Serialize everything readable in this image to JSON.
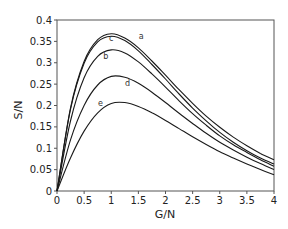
{
  "chart_data": {
    "type": "line",
    "title": "",
    "xlabel": "G/N",
    "ylabel": "S/N",
    "xlim": [
      0,
      4
    ],
    "ylim": [
      0,
      0.4
    ],
    "grid": false,
    "legend": "inline labels",
    "x_ticks": [
      "0",
      "0.5",
      "1",
      "1.5",
      "2",
      "2.5",
      "3",
      "3.5",
      "4"
    ],
    "y_ticks": [
      "0",
      "0.05",
      "0.1",
      "0.15",
      "0.2",
      "0.25",
      "0.3",
      "0.35",
      "0.4"
    ],
    "x": [
      0,
      0.25,
      0.5,
      0.75,
      1.0,
      1.25,
      1.5,
      1.75,
      2.0,
      2.25,
      2.5,
      2.75,
      3.0,
      3.25,
      3.5,
      3.75,
      4.0
    ],
    "series": [
      {
        "name": "a",
        "label_pos": [
          1.55,
          0.355
        ],
        "values": [
          0,
          0.195,
          0.303,
          0.354,
          0.368,
          0.358,
          0.335,
          0.304,
          0.271,
          0.237,
          0.205,
          0.175,
          0.149,
          0.126,
          0.106,
          0.088,
          0.073
        ]
      },
      {
        "name": "c",
        "label_pos": [
          1.0,
          0.35
        ],
        "values": [
          0,
          0.192,
          0.299,
          0.349,
          0.362,
          0.352,
          0.328,
          0.296,
          0.262,
          0.227,
          0.194,
          0.164,
          0.137,
          0.114,
          0.094,
          0.077,
          0.063
        ]
      },
      {
        "name": "b",
        "label_pos": [
          0.9,
          0.308
        ],
        "values": [
          0,
          0.165,
          0.265,
          0.315,
          0.33,
          0.323,
          0.302,
          0.274,
          0.243,
          0.211,
          0.181,
          0.154,
          0.129,
          0.108,
          0.09,
          0.073,
          0.058
        ]
      },
      {
        "name": "d",
        "label_pos": [
          1.3,
          0.245
        ],
        "values": [
          0,
          0.12,
          0.2,
          0.248,
          0.268,
          0.266,
          0.252,
          0.231,
          0.207,
          0.182,
          0.158,
          0.135,
          0.114,
          0.096,
          0.079,
          0.064,
          0.05
        ]
      },
      {
        "name": "e",
        "label_pos": [
          0.8,
          0.2
        ],
        "values": [
          0,
          0.078,
          0.14,
          0.183,
          0.205,
          0.207,
          0.198,
          0.183,
          0.165,
          0.146,
          0.127,
          0.109,
          0.092,
          0.077,
          0.063,
          0.05,
          0.038
        ]
      }
    ]
  }
}
